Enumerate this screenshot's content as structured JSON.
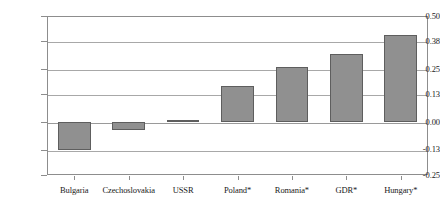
{
  "chart_data": {
    "type": "bar",
    "title": "",
    "subtitle": "",
    "xlabel": "",
    "ylabel": "",
    "categories": [
      "Bulgaria",
      "Czechoslovakia",
      "USSR",
      "Poland*",
      "Romania*",
      "GDR*",
      "Hungary*"
    ],
    "values": [
      -0.13,
      -0.04,
      0.01,
      0.17,
      0.26,
      0.32,
      0.41
    ],
    "ylim": [
      -0.25,
      0.5
    ],
    "ytick_labels": [
      "0.50",
      "0.38",
      "0.25",
      "0.13",
      "0.00",
      "-0.13",
      "-0.25"
    ],
    "ytick_values": [
      0.5,
      0.38,
      0.25,
      0.13,
      0.0,
      -0.13,
      -0.25
    ],
    "grid": true,
    "legend": false,
    "legend_position": "none",
    "bar_color": "#909090",
    "bar_border_color": "#5e5e5e",
    "gridline_color": "#a8a8a8",
    "frame_color": "#8d8d8d",
    "annotations": []
  }
}
